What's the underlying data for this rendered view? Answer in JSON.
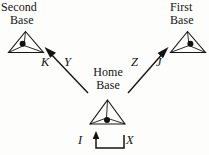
{
  "diagram": {
    "background_color": "#fdfdfc",
    "ink_color": "#151515",
    "bases": [
      {
        "id": "second-base",
        "label_line1": "Second",
        "label_line2": "Base",
        "icon": "home-plate-triangle-icon"
      },
      {
        "id": "first-base",
        "label_line1": "First",
        "label_line2": "Base",
        "icon": "home-plate-triangle-icon"
      },
      {
        "id": "home-base",
        "label_line1": "Home",
        "label_line2": "Base",
        "icon": "home-plate-triangle-icon"
      }
    ],
    "vectors": [
      {
        "id": "home-to-second",
        "left_label": "K",
        "right_label": "Y",
        "direction": "up-left",
        "from": "Home Base",
        "to": "Second Base"
      },
      {
        "id": "home-to-first",
        "left_label": "Z",
        "right_label": "J",
        "direction": "up-right",
        "from": "Home Base",
        "to": "First Base"
      }
    ],
    "bracket": {
      "id": "bottom-bracket",
      "left_label": "I",
      "right_label": "X",
      "shape": "u-bracket-with-up-arrow"
    }
  }
}
